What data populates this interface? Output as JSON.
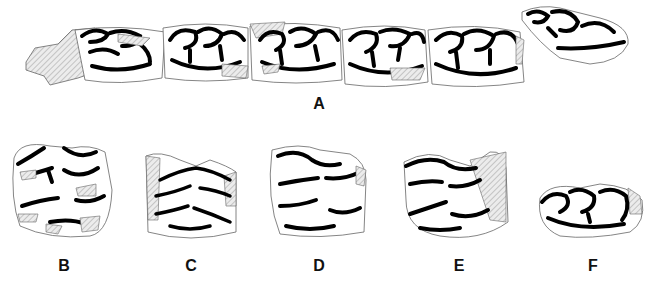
{
  "figure": {
    "panels": [
      {
        "id": "A",
        "label": "A",
        "x": 319,
        "y": 108,
        "content": "tooth row of five molariform teeth plus isolated tooth"
      },
      {
        "id": "B",
        "label": "B",
        "x": 64,
        "y": 261,
        "content": "isolated upper cheek tooth"
      },
      {
        "id": "C",
        "label": "C",
        "x": 191,
        "y": 261,
        "content": "isolated upper cheek tooth"
      },
      {
        "id": "D",
        "label": "D",
        "x": 319,
        "y": 261,
        "content": "isolated upper cheek tooth"
      },
      {
        "id": "E",
        "label": "E",
        "x": 459,
        "y": 261,
        "content": "isolated upper cheek tooth"
      },
      {
        "id": "F",
        "label": "F",
        "x": 593,
        "y": 261,
        "content": "isolated lower cheek tooth"
      }
    ],
    "legend": {
      "hatched_area": "broken / reconstructed region",
      "thick_black_line": "enamel"
    },
    "colors": {
      "enamel": "#000000",
      "outline": "#555555",
      "hatch": "#999999",
      "hatch_fill": "#e6e6e6",
      "background": "#ffffff"
    }
  }
}
